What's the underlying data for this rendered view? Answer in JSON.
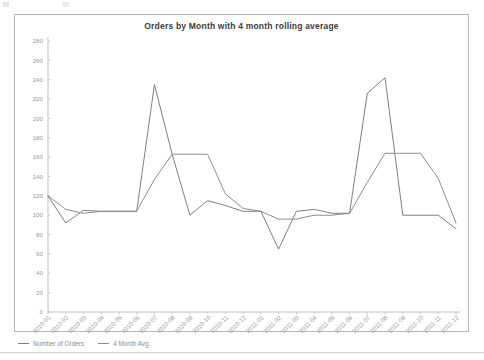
{
  "chart_data": {
    "type": "line",
    "title": "Orders by Month with 4 month rolling average",
    "xlabel": "",
    "ylabel": "",
    "ylim": [
      0,
      280
    ],
    "ytick_step": 20,
    "yticks": [
      0,
      20,
      40,
      60,
      80,
      100,
      120,
      140,
      160,
      180,
      200,
      220,
      240,
      260,
      280
    ],
    "grid": false,
    "legend_position": "bottom-left",
    "categories": [
      "2010-01",
      "2010-02",
      "2010-03",
      "2010-04",
      "2010-05",
      "2010-06",
      "2010-07",
      "2010-08",
      "2010-09",
      "2010-10",
      "2010-11",
      "2010-12",
      "2011-01",
      "2011-02",
      "2011-03",
      "2011-04",
      "2011-05",
      "2011-06",
      "2011-07",
      "2011-08",
      "2011-09",
      "2011-10",
      "2011-11",
      "2011-12"
    ],
    "series": [
      {
        "name": "Number of Orders",
        "color": "#7f7f7f",
        "values": [
          120,
          92,
          105,
          104,
          104,
          104,
          235,
          163,
          100,
          115,
          110,
          104,
          104,
          65,
          104,
          106,
          102,
          102,
          226,
          242,
          100,
          100,
          100,
          86
        ]
      },
      {
        "name": "4 Month Avg.",
        "color": "#8c8c8c",
        "values": [
          120,
          106,
          102,
          104,
          104,
          104,
          137,
          163,
          163,
          163,
          122,
          107,
          104,
          96,
          96,
          100,
          100,
          102,
          134,
          164,
          164,
          164,
          138,
          92
        ]
      }
    ]
  },
  "legend": {
    "entries": [
      {
        "label": "Number of Orders"
      },
      {
        "label": "4 Month Avg."
      }
    ]
  },
  "colors": {
    "card_border": "#b8b8b8",
    "axis": "#b0b0b0",
    "tick_text": "#9a9a9a",
    "title_text": "#3b3b3b",
    "series_orders": "#7f7f7f",
    "series_avg": "#8c8c8c",
    "background": "#ffffff"
  }
}
